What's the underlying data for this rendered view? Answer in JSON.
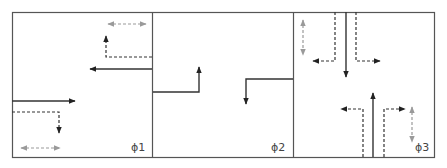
{
  "diagram": {
    "colors": {
      "border": "#555555",
      "vehicle_solid": "#333333",
      "vehicle_dashed": "#333333",
      "pedestrian": "#999999",
      "background": "#ffffff"
    },
    "panels": [
      {
        "id": "phase-1",
        "label": "ϕ1",
        "movements": [
          {
            "type": "pedestrian",
            "desc": "crosswalk top, bidirectional",
            "orientation": "horizontal"
          },
          {
            "type": "left-turn-permitted",
            "desc": "dashed from east, turning north"
          },
          {
            "type": "through",
            "desc": "solid westbound from east edge"
          },
          {
            "type": "through",
            "desc": "solid eastbound from west edge"
          },
          {
            "type": "right-turn-permitted",
            "desc": "dashed from west, turning south"
          },
          {
            "type": "pedestrian",
            "desc": "crosswalk bottom, bidirectional",
            "orientation": "horizontal"
          }
        ]
      },
      {
        "id": "phase-2",
        "label": "ϕ2",
        "movements": [
          {
            "type": "left-turn-protected",
            "desc": "solid from west edge, turning north"
          },
          {
            "type": "left-turn-protected",
            "desc": "solid from east edge, turning south"
          }
        ]
      },
      {
        "id": "phase-3",
        "label": "ϕ3",
        "movements": [
          {
            "type": "pedestrian",
            "desc": "crosswalk left, bidirectional",
            "orientation": "vertical"
          },
          {
            "type": "right-turn-permitted",
            "desc": "dashed from north, turning west"
          },
          {
            "type": "through",
            "desc": "solid southbound from north edge"
          },
          {
            "type": "left-turn-permitted",
            "desc": "dashed from north, turning east"
          },
          {
            "type": "left-turn-permitted",
            "desc": "dashed from south, turning west"
          },
          {
            "type": "through",
            "desc": "solid northbound from south edge"
          },
          {
            "type": "right-turn-permitted",
            "desc": "dashed from south, turning east"
          },
          {
            "type": "pedestrian",
            "desc": "crosswalk right, bidirectional",
            "orientation": "vertical"
          }
        ]
      }
    ]
  }
}
